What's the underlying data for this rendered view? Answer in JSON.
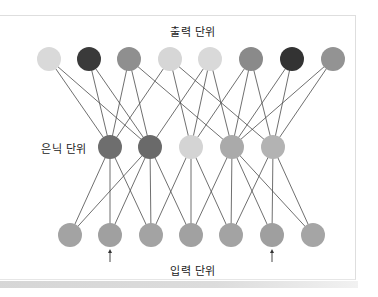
{
  "labels": {
    "output": "출력 단위",
    "hidden": "은닉 단위",
    "input": "입력 단위"
  },
  "style": {
    "edge_color": "#4a4a4a",
    "node_radius": 12
  },
  "layers": {
    "output": {
      "y": 59,
      "nodes": [
        {
          "x": 49,
          "color": "#d9d9d9"
        },
        {
          "x": 89,
          "color": "#3a3a3a"
        },
        {
          "x": 129,
          "color": "#8f8f8f"
        },
        {
          "x": 170,
          "color": "#d6d6d6"
        },
        {
          "x": 210,
          "color": "#d9d9d9"
        },
        {
          "x": 251,
          "color": "#8a8a8a"
        },
        {
          "x": 292,
          "color": "#333333"
        },
        {
          "x": 333,
          "color": "#939393"
        }
      ]
    },
    "hidden": {
      "y": 147,
      "nodes": [
        {
          "x": 110,
          "color": "#6e6e6e"
        },
        {
          "x": 150,
          "color": "#6a6a6a"
        },
        {
          "x": 191,
          "color": "#d4d4d4"
        },
        {
          "x": 232,
          "color": "#aaaaaa"
        },
        {
          "x": 273,
          "color": "#b3b3b3"
        }
      ]
    },
    "input": {
      "y": 235,
      "nodes": [
        {
          "x": 70,
          "color": "#a3a3a3"
        },
        {
          "x": 110,
          "color": "#a0a0a0"
        },
        {
          "x": 151,
          "color": "#a3a3a3"
        },
        {
          "x": 191,
          "color": "#a1a1a1"
        },
        {
          "x": 231,
          "color": "#a3a3a3"
        },
        {
          "x": 272,
          "color": "#9f9f9f"
        },
        {
          "x": 313,
          "color": "#a5a5a5"
        }
      ]
    }
  },
  "edges": {
    "output_to_hidden": [
      [
        0,
        0
      ],
      [
        0,
        1
      ],
      [
        1,
        0
      ],
      [
        1,
        1
      ],
      [
        2,
        0
      ],
      [
        2,
        1
      ],
      [
        2,
        3
      ],
      [
        3,
        0
      ],
      [
        3,
        2
      ],
      [
        3,
        4
      ],
      [
        4,
        1
      ],
      [
        4,
        2
      ],
      [
        4,
        3
      ],
      [
        5,
        2
      ],
      [
        5,
        3
      ],
      [
        5,
        4
      ],
      [
        6,
        3
      ],
      [
        6,
        4
      ],
      [
        7,
        3
      ],
      [
        7,
        4
      ]
    ],
    "hidden_to_input": [
      [
        0,
        0
      ],
      [
        0,
        1
      ],
      [
        0,
        2
      ],
      [
        1,
        0
      ],
      [
        1,
        1
      ],
      [
        1,
        2
      ],
      [
        1,
        3
      ],
      [
        2,
        2
      ],
      [
        2,
        3
      ],
      [
        2,
        4
      ],
      [
        3,
        3
      ],
      [
        3,
        4
      ],
      [
        3,
        5
      ],
      [
        3,
        6
      ],
      [
        4,
        4
      ],
      [
        4,
        5
      ],
      [
        4,
        6
      ]
    ]
  },
  "arrows": [
    {
      "x": 110,
      "y_from": 262,
      "y_to": 249
    },
    {
      "x": 272,
      "y_from": 262,
      "y_to": 249
    }
  ]
}
